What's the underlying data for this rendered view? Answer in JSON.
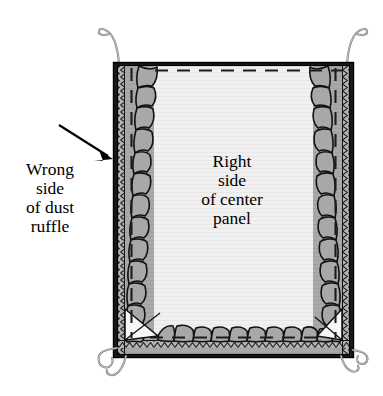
{
  "figure": {
    "type": "sewing-instruction-diagram",
    "background_color": "#ffffff"
  },
  "labels": {
    "left": {
      "name": "wrong-side-of-dust-ruffle-label",
      "lines": [
        "Wrong",
        "side",
        "of dust",
        "ruffle"
      ],
      "line1": "Wrong",
      "line2": "side",
      "line3": "of dust",
      "line4": "ruffle",
      "color": "#000000"
    },
    "center": {
      "name": "right-side-of-center-panel-label",
      "lines": [
        "Right",
        "side",
        "of center",
        "panel"
      ],
      "line1": "Right",
      "line2": "side",
      "line3": "of center",
      "line4": "panel",
      "color": "#000000"
    }
  },
  "pointer": {
    "name": "arrow-to-ruffle-edge",
    "description": "arrow pointing down-right to left serged edge",
    "color": "#000000"
  },
  "colors": {
    "center_panel": "#f0f0f0",
    "ruffle_fabric": "#a8a8a8",
    "border_dark": "#1a1a1a",
    "serge_strip": "#9a9a9a",
    "seam_dash": "#262626",
    "tie_string": "#8c8c8c",
    "outline": "#000000"
  },
  "parts": {
    "center_panel": "Right side of center panel",
    "dust_ruffle": "Wrong side of dust ruffle",
    "serged_edge": "serged zigzag edge",
    "seam_line": "dashed seam line",
    "mitered_corner": "mitered bottom corner",
    "tie_strings": "corner tie strings",
    "tie_count": 4
  }
}
